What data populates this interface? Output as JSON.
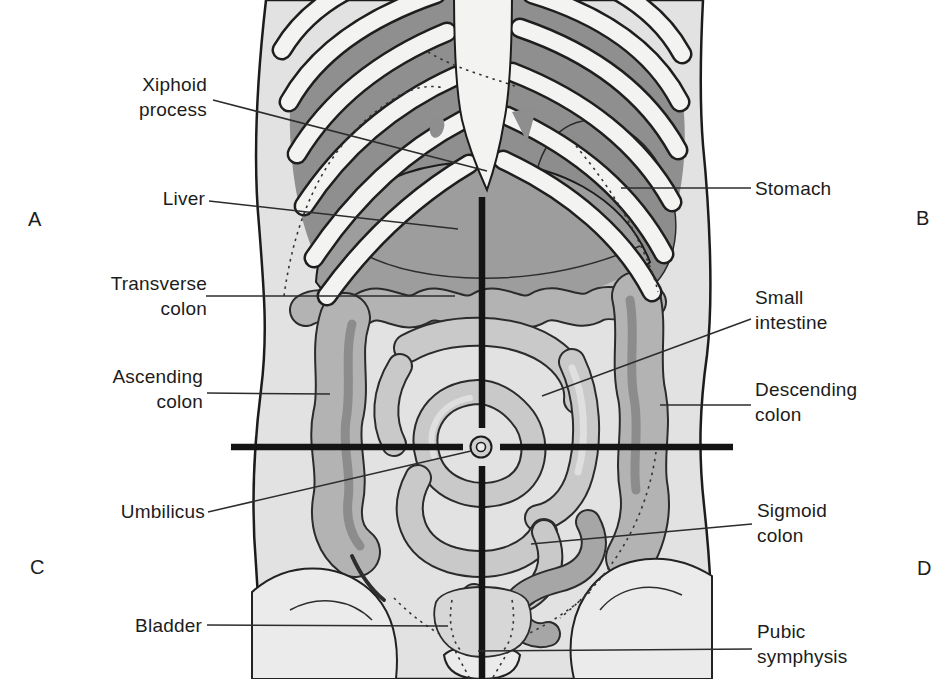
{
  "figure": {
    "quadrants": [
      {
        "letter": "A"
      },
      {
        "letter": "B"
      },
      {
        "letter": "C"
      },
      {
        "letter": "D"
      }
    ],
    "left_labels": [
      {
        "text": "Xiphoid process"
      },
      {
        "text": "Liver"
      },
      {
        "text": "Transverse colon"
      },
      {
        "text": "Ascending colon"
      },
      {
        "text": "Umbilicus"
      },
      {
        "text": "Bladder"
      }
    ],
    "right_labels": [
      {
        "text": "Stomach"
      },
      {
        "text": "Small intestine"
      },
      {
        "text": "Descending colon"
      },
      {
        "text": "Sigmoid colon"
      },
      {
        "text": "Pubic symphysis"
      }
    ],
    "colors": {
      "ink": "#1c1c1c",
      "skin": "#e2e2e2",
      "rib": "#f3f3f1",
      "cavity": "#8f8f8f",
      "organ_dark": "#8d8d8d",
      "liver": "#9d9d9d",
      "colon": "#b3b3b3",
      "intestine": "#c9c9c9",
      "crosshair": "#141414"
    }
  }
}
